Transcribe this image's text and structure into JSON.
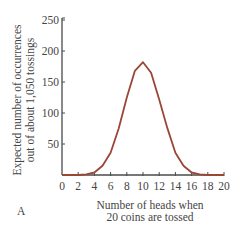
{
  "chart_data": {
    "type": "line",
    "title": "",
    "xlabel": "Number of heads when 20 coins are tossed",
    "xlabel_lines": [
      "Number of heads when",
      "20 coins are tossed"
    ],
    "ylabel": "Expected number of occurrences out of about 1,050 tossings",
    "ylabel_lines": [
      "Expected number of occurrences",
      "out of about 1,050 tossings"
    ],
    "panel_label": "A",
    "x": [
      0,
      1,
      2,
      3,
      4,
      5,
      6,
      7,
      8,
      9,
      10,
      11,
      12,
      13,
      14,
      15,
      16,
      17,
      18,
      19,
      20
    ],
    "series": [
      {
        "name": "Expected occurrences",
        "color": "#9a4636",
        "values": [
          0,
          0,
          0,
          1,
          4,
          15,
          36,
          75,
          125,
          168,
          182,
          165,
          122,
          76,
          36,
          15,
          4,
          1,
          0,
          0,
          0
        ]
      }
    ],
    "xticks": [
      0,
      2,
      4,
      6,
      8,
      10,
      12,
      14,
      16,
      18,
      20
    ],
    "xtick_labels": [
      "0",
      "2",
      "4",
      "6",
      "8",
      "10",
      "12",
      "14",
      "16",
      "18",
      "20"
    ],
    "yticks": [
      50,
      100,
      150,
      200,
      250
    ],
    "ytick_labels": [
      "50",
      "100",
      "150",
      "200",
      "250"
    ],
    "xlim": [
      0,
      20
    ],
    "ylim": [
      0,
      250
    ],
    "grid": false,
    "legend": "none"
  },
  "colors": {
    "axis": "#4a4a4a",
    "curve": "#9a4636",
    "text": "#444444"
  }
}
